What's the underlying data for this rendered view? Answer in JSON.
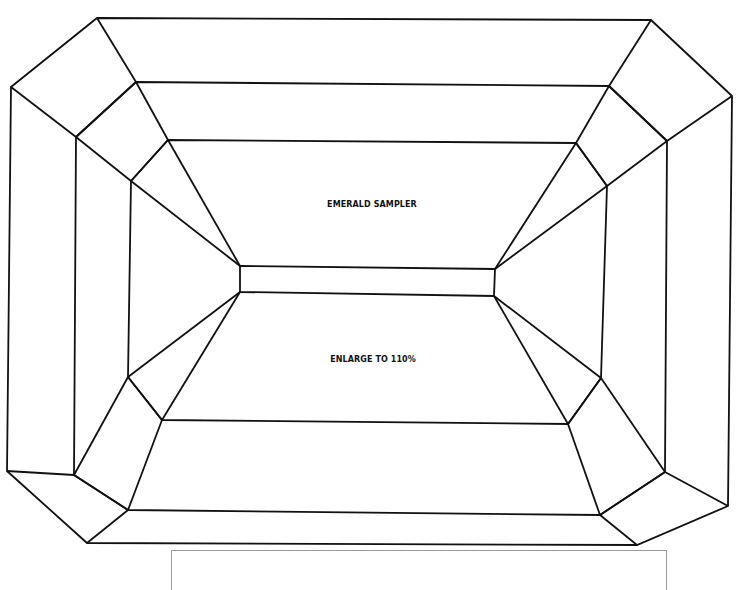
{
  "diagram": {
    "type": "emerald-cut gemstone facet template",
    "labels": {
      "title": "EMERALD SAMPLER",
      "instruction": "ENLARGE TO 110%"
    },
    "colors": {
      "line": "#111111",
      "background": "#ffffff",
      "box_border": "#9a9a9a"
    }
  }
}
